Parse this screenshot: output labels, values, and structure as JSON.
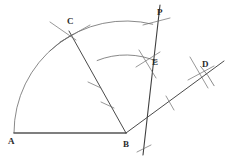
{
  "figure": {
    "stroke_color": "#4a4a4a",
    "baseline_color": "#555555",
    "arc_color": "#6b6b6b",
    "label_color": "#2b2b2b",
    "background": "#ffffff"
  },
  "points": [
    {
      "id": "A",
      "label": "A",
      "x": 14,
      "y": 133,
      "label_x": 8,
      "label_y": 137
    },
    {
      "id": "B",
      "label": "B",
      "x": 126,
      "y": 133,
      "label_x": 123,
      "label_y": 140
    },
    {
      "id": "C",
      "label": "C",
      "x": 70,
      "y": 32,
      "label_x": 67,
      "label_y": 17
    },
    {
      "id": "D",
      "label": "D",
      "x": 203,
      "y": 74,
      "label_x": 202,
      "label_y": 60
    },
    {
      "id": "E",
      "label": "E",
      "x": 148,
      "y": 60,
      "label_x": 152,
      "label_y": 58
    },
    {
      "id": "P",
      "label": "P",
      "x": 155,
      "y": 20,
      "label_x": 157,
      "label_y": 8
    }
  ],
  "segments": [
    {
      "name": "baseline-ab",
      "x1": 14,
      "y1": 133,
      "x2": 126,
      "y2": 133,
      "width": 1.6,
      "color": "#555555"
    },
    {
      "name": "ray-bc",
      "x1": 126,
      "y1": 133,
      "x2": 69,
      "y2": 31,
      "width": 1.0,
      "color": "#4a4a4a"
    },
    {
      "name": "ray-bp",
      "x1": 143,
      "y1": 155,
      "x2": 160,
      "y2": 5,
      "width": 1.1,
      "color": "#3f3f3f"
    },
    {
      "name": "ray-bd",
      "x1": 126,
      "y1": 133,
      "x2": 224,
      "y2": 61,
      "width": 1.0,
      "color": "#4a4a4a"
    }
  ],
  "construction_arcs": [
    {
      "name": "main-arc-a-to-top",
      "cx": 126,
      "cy": 133,
      "r": 112,
      "start_deg": 180,
      "end_deg": 76
    },
    {
      "name": "arc-at-c-1",
      "cx": 126,
      "cy": 133,
      "r": 112,
      "start_deg": 133,
      "end_deg": 118
    },
    {
      "name": "arc-near-e",
      "cx": 126,
      "cy": 133,
      "r": 78,
      "start_deg": 112,
      "end_deg": 66
    },
    {
      "name": "arc-near-d",
      "cx": 126,
      "cy": 133,
      "r": 100,
      "start_deg": 42,
      "end_deg": 28
    }
  ],
  "tick_marks": [
    {
      "name": "tick-bc-upper",
      "x1": 88,
      "y1": 82,
      "x2": 101,
      "y2": 88
    },
    {
      "name": "tick-bc-lower",
      "x1": 101,
      "y1": 102,
      "x2": 114,
      "y2": 108
    },
    {
      "name": "tick-bd-mid",
      "x1": 166,
      "y1": 96,
      "x2": 174,
      "y2": 110
    },
    {
      "name": "tick-bp-below",
      "x1": 137,
      "y1": 152,
      "x2": 151,
      "y2": 145
    },
    {
      "name": "tick-c-left",
      "x1": 50,
      "y1": 22,
      "x2": 76,
      "y2": 40
    },
    {
      "name": "tick-c-right",
      "x1": 60,
      "y1": 42,
      "x2": 90,
      "y2": 25
    },
    {
      "name": "tick-p-cross",
      "x1": 143,
      "y1": 25,
      "x2": 170,
      "y2": 18
    },
    {
      "name": "tick-e-cross-1",
      "x1": 136,
      "y1": 67,
      "x2": 160,
      "y2": 52
    },
    {
      "name": "tick-e-cross-2",
      "x1": 139,
      "y1": 50,
      "x2": 156,
      "y2": 78
    },
    {
      "name": "tick-d-cross-1",
      "x1": 190,
      "y1": 57,
      "x2": 208,
      "y2": 88
    },
    {
      "name": "tick-d-cross-2",
      "x1": 188,
      "y1": 80,
      "x2": 214,
      "y2": 66
    }
  ]
}
